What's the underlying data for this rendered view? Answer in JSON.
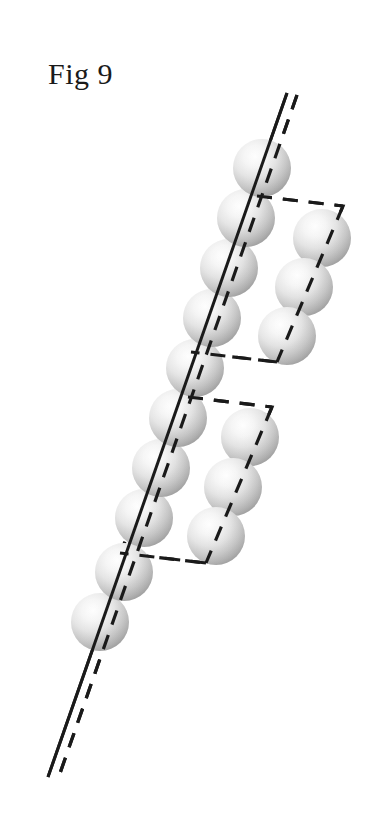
{
  "figure": {
    "caption": "Fig 9",
    "caption_position": {
      "x": 48,
      "y": 59
    },
    "background_color": "#ffffff",
    "ink_color": "#1a1a1a",
    "canvas": {
      "width": 375,
      "height": 819
    }
  },
  "sphere_style": {
    "highlight_color": "#fdfdfd",
    "mid_color": "#e3e3e3",
    "shadow_color": "#a9a9a9",
    "edge_color": "#9a9a9a",
    "radius": 29,
    "highlight_offset": {
      "cx": "38%",
      "cy": "30%"
    }
  },
  "line_style": {
    "solid_stroke": "#1a1a1a",
    "solid_width": 3,
    "dashed_stroke": "#1a1a1a",
    "dashed_width": 3.2,
    "dash_pattern": "15 11"
  },
  "spheres": {
    "main_chain": [
      {
        "id": "chain-1",
        "cx": 262,
        "cy": 168
      },
      {
        "id": "chain-2",
        "cx": 246,
        "cy": 218
      },
      {
        "id": "chain-3",
        "cx": 229,
        "cy": 268
      },
      {
        "id": "chain-4",
        "cx": 212,
        "cy": 318
      },
      {
        "id": "chain-5",
        "cx": 195,
        "cy": 368
      },
      {
        "id": "chain-6",
        "cx": 178,
        "cy": 418
      },
      {
        "id": "chain-7",
        "cx": 161,
        "cy": 468
      },
      {
        "id": "chain-8",
        "cx": 144,
        "cy": 518
      },
      {
        "id": "chain-9",
        "cx": 124,
        "cy": 572
      },
      {
        "id": "chain-10",
        "cx": 100,
        "cy": 622
      }
    ],
    "upper_branch": [
      {
        "id": "upper-branch-1",
        "cx": 322,
        "cy": 238
      },
      {
        "id": "upper-branch-2",
        "cx": 304,
        "cy": 287
      },
      {
        "id": "upper-branch-3",
        "cx": 287,
        "cy": 336
      }
    ],
    "lower_branch": [
      {
        "id": "lower-branch-1",
        "cx": 250,
        "cy": 437
      },
      {
        "id": "lower-branch-2",
        "cx": 233,
        "cy": 487
      },
      {
        "id": "lower-branch-3",
        "cx": 216,
        "cy": 536
      }
    ]
  },
  "lines": {
    "axis_solid": {
      "x1": 287,
      "y1": 93,
      "x2": 48,
      "y2": 777
    },
    "axis_dashed": {
      "x1": 297,
      "y1": 95,
      "x2": 58,
      "y2": 779
    },
    "upper_outline": [
      {
        "x": 257,
        "y": 196
      },
      {
        "x": 343,
        "y": 206
      },
      {
        "x": 277,
        "y": 362
      },
      {
        "x": 191,
        "y": 352
      }
    ],
    "lower_outline": [
      {
        "x": 188,
        "y": 397
      },
      {
        "x": 272,
        "y": 407
      },
      {
        "x": 206,
        "y": 563
      },
      {
        "x": 120,
        "y": 553
      }
    ]
  }
}
